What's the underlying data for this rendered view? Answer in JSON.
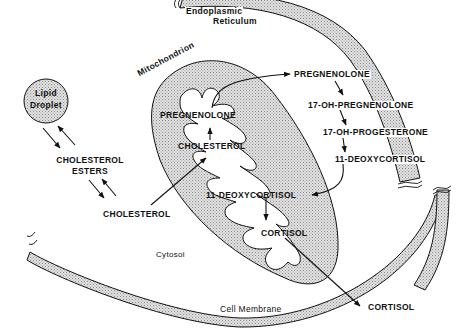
{
  "diagram": {
    "compartments": {
      "lipid_droplet": "Lipid Droplet",
      "lipid_droplet_line1": "Lipid",
      "lipid_droplet_line2": "Droplet",
      "er_line1": "Endoplasmic",
      "er_line2": "Reticulum",
      "mitochondrion": "Mitochondrion",
      "cytosol": "Cytosol",
      "cell_membrane": "Cell Membrane"
    },
    "molecules": {
      "cholesterol_esters_line1": "CHOLESTEROL",
      "cholesterol_esters_line2": "ESTERS",
      "cholesterol_cytosol": "CHOLESTEROL",
      "cholesterol_mito": "CHOLESTEROL",
      "pregnenolone_mito": "PREGNENOLONE",
      "pregnenolone_er": "PREGNENOLONE",
      "oh17_pregnenolone": "17-OH-PREGNENOLONE",
      "oh17_progesterone": "17-OH-PROGESTERONE",
      "deoxycortisol_er": "11-DEOXYCORTISOL",
      "deoxycortisol_mito": "11-DEOXYCORTISOL",
      "cortisol_mito": "CORTISOL",
      "cortisol_out": "CORTISOL"
    },
    "pathway": [
      {
        "from": "Lipid Droplet",
        "to": "CHOLESTEROL ESTERS",
        "type": "bidirectional"
      },
      {
        "from": "CHOLESTEROL ESTERS",
        "to": "CHOLESTEROL",
        "type": "bidirectional"
      },
      {
        "from": "CHOLESTEROL",
        "to": "CHOLESTEROL (mitochondrion)"
      },
      {
        "from": "CHOLESTEROL (mitochondrion)",
        "to": "PREGNENOLONE (mitochondrion)"
      },
      {
        "from": "PREGNENOLONE (mitochondrion)",
        "to": "PREGNENOLONE (ER)"
      },
      {
        "from": "PREGNENOLONE (ER)",
        "to": "17-OH-PREGNENOLONE"
      },
      {
        "from": "17-OH-PREGNENOLONE",
        "to": "17-OH-PROGESTERONE"
      },
      {
        "from": "17-OH-PROGESTERONE",
        "to": "11-DEOXYCORTISOL (ER)"
      },
      {
        "from": "11-DEOXYCORTISOL (ER)",
        "to": "11-DEOXYCORTISOL (mitochondrion)"
      },
      {
        "from": "11-DEOXYCORTISOL (mitochondrion)",
        "to": "CORTISOL (mitochondrion)"
      },
      {
        "from": "CORTISOL (mitochondrion)",
        "to": "CORTISOL (extracellular)"
      }
    ],
    "colors": {
      "stroke": "#111111",
      "fill_stipple": "#d4d4d4",
      "background": "#ffffff"
    }
  }
}
